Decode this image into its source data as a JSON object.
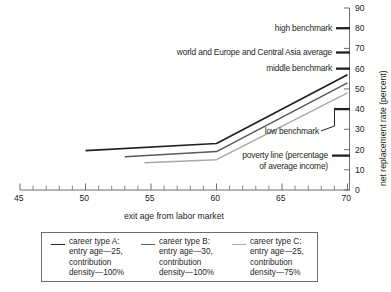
{
  "chart_data": {
    "type": "line",
    "title": "",
    "xlabel": "exit age from labor market",
    "ylabel": "net replacement rate (percent)",
    "xlim": [
      45,
      70
    ],
    "ylim": [
      0,
      90
    ],
    "xticks": [
      45,
      50,
      55,
      60,
      65,
      70
    ],
    "xtick_labels": [
      "45",
      "50",
      "55",
      "60",
      "65",
      "70"
    ],
    "x_minor_step": 1,
    "yticks": [
      0,
      10,
      20,
      30,
      40,
      50,
      60,
      70,
      80,
      90
    ],
    "ytick_labels": [
      "0",
      "10",
      "20",
      "30",
      "40",
      "50",
      "60",
      "70",
      "80",
      "90"
    ],
    "grid": false,
    "legend_position": "bottom",
    "series": [
      {
        "name": "career type A",
        "label": "career type  A: entry age—25, contribution density—100%",
        "color": "#231f20",
        "width": 1.7,
        "x": [
          50,
          60,
          70
        ],
        "y": [
          19.5,
          23.0,
          57.0
        ]
      },
      {
        "name": "career type B",
        "label": "career type  B: entry age—30, contribution density—100%",
        "color": "#58595b",
        "width": 1.5,
        "x": [
          53,
          60,
          70
        ],
        "y": [
          16.5,
          19.0,
          53.0
        ]
      },
      {
        "name": "career type C",
        "label": "career type  C: entry age—25, contribution density—75%",
        "color": "#a7a9ac",
        "width": 1.5,
        "x": [
          54.5,
          60,
          70
        ],
        "y": [
          13.5,
          15.0,
          48.0
        ]
      }
    ],
    "reference_markers": [
      {
        "name": "high benchmark",
        "label": "high benchmark",
        "value": 80
      },
      {
        "name": "world and Europe and Central Asia average",
        "label": "world and Europe and Central Asia average",
        "value": 68
      },
      {
        "name": "middle benchmark",
        "label": "middle benchmark",
        "value": 60
      },
      {
        "name": "low benchmark",
        "label": "low benchmark",
        "value": 40
      },
      {
        "name": "poverty line",
        "label": "poverty line (percentage",
        "label_line2": "of average income)",
        "value": 17
      }
    ]
  },
  "axes": {
    "x_title": "exit age from labor market",
    "y_title": "net replacement rate (percent)",
    "x_tick_45": "45",
    "x_tick_50": "50",
    "x_tick_55": "55",
    "x_tick_60": "60",
    "x_tick_65": "65",
    "x_tick_70": "70",
    "y_tick_0": "0",
    "y_tick_10": "10",
    "y_tick_20": "20",
    "y_tick_30": "30",
    "y_tick_40": "40",
    "y_tick_50": "50",
    "y_tick_60": "60",
    "y_tick_70": "70",
    "y_tick_80": "80",
    "y_tick_90": "90"
  },
  "annotations": {
    "high_benchmark": "high benchmark",
    "world_average": "world and Europe and Central Asia average",
    "middle_benchmark": "middle benchmark",
    "low_benchmark": "low benchmark",
    "poverty_line_1": "poverty line (percentage",
    "poverty_line_2": "of average income)"
  },
  "legend": {
    "items": [
      {
        "color": "#231f20",
        "l1": "career type  A:",
        "l2": "entry age—25,",
        "l3": "contribution",
        "l4": "density—100%"
      },
      {
        "color": "#58595b",
        "l1": "career type  B:",
        "l2": "entry age—30,",
        "l3": "contribution",
        "l4": "density—100%"
      },
      {
        "color": "#a7a9ac",
        "l1": "career type  C:",
        "l2": "entry age—25,",
        "l3": "contribution",
        "l4": "density—75%"
      }
    ]
  }
}
